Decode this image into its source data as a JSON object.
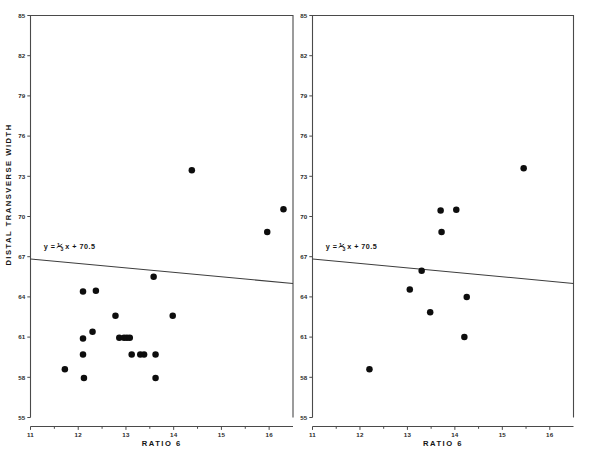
{
  "figure": {
    "background": "#ffffff",
    "ink_color": "#141414",
    "point_color": "#0d0d0d",
    "axis_color": "#4a4a4a"
  },
  "shared": {
    "ylabel": "DISTAL  TRANSVERSE  WIDTH",
    "xlabel": "RATIO  6",
    "yticks": [
      55,
      58,
      61,
      64,
      67,
      70,
      73,
      76,
      79,
      82,
      85
    ],
    "ytick_labels": [
      "55",
      "58",
      "61",
      "64",
      "67",
      "70",
      "73",
      "76",
      "79",
      "82",
      "85"
    ],
    "xticks": [
      11,
      12,
      13,
      14,
      15,
      16
    ],
    "xtick_labels": [
      "11",
      "12",
      "13",
      "14",
      "15",
      "16"
    ],
    "xminor": [
      11.5,
      12.5,
      13.5,
      14.5,
      15.5
    ],
    "ylim": [
      55,
      85
    ],
    "xlim": [
      11,
      16.5
    ],
    "equation_text": "y = −",
    "equation_num": "1",
    "equation_den": "3",
    "equation_tail": "x + 70.5"
  },
  "chart_data": [
    {
      "type": "scatter",
      "panel": "left",
      "title": "",
      "xlabel": "RATIO  6",
      "ylabel": "DISTAL  TRANSVERSE  WIDTH",
      "xlim": [
        11,
        16.5
      ],
      "ylim": [
        55,
        85
      ],
      "grid": false,
      "legend": null,
      "annotations": [
        {
          "text": "y = -1/3 x + 70.5",
          "x": 11.28,
          "y": 67.55
        }
      ],
      "series": [
        {
          "name": "observations",
          "marker": "filled-circle",
          "color": "#0d0d0d",
          "points": [
            [
              11.72,
              58.6
            ],
            [
              12.1,
              60.9
            ],
            [
              12.1,
              59.7
            ],
            [
              12.1,
              64.4
            ],
            [
              12.12,
              57.95
            ],
            [
              12.3,
              61.4
            ],
            [
              12.37,
              64.45
            ],
            [
              12.78,
              62.6
            ],
            [
              12.86,
              60.95
            ],
            [
              12.96,
              60.95
            ],
            [
              13.02,
              60.95
            ],
            [
              13.08,
              60.95
            ],
            [
              13.12,
              59.7
            ],
            [
              13.3,
              59.7
            ],
            [
              13.38,
              59.7
            ],
            [
              13.58,
              65.5
            ],
            [
              13.62,
              59.7
            ],
            [
              13.62,
              57.95
            ],
            [
              13.98,
              62.6
            ],
            [
              14.38,
              73.45
            ],
            [
              15.96,
              68.85
            ],
            [
              16.3,
              70.55
            ]
          ]
        }
      ],
      "regression": {
        "label": "y = -1/3 x + 70.5",
        "slope": -0.3333,
        "intercept": 70.5,
        "x_start": 11.0,
        "x_end": 16.5,
        "y_start": 66.83,
        "y_end": 65.0
      }
    },
    {
      "type": "scatter",
      "panel": "right",
      "title": "",
      "xlabel": "RATIO  6",
      "ylabel": "",
      "xlim": [
        11,
        16.5
      ],
      "ylim": [
        55,
        85
      ],
      "grid": false,
      "legend": null,
      "annotations": [
        {
          "text": "y = -1/3 x + 70.5",
          "x": 11.28,
          "y": 67.55
        }
      ],
      "series": [
        {
          "name": "observations",
          "marker": "filled-circle",
          "color": "#0d0d0d",
          "points": [
            [
              12.2,
              58.6
            ],
            [
              13.05,
              64.55
            ],
            [
              13.3,
              65.95
            ],
            [
              13.48,
              62.85
            ],
            [
              13.7,
              70.45
            ],
            [
              13.72,
              68.85
            ],
            [
              14.03,
              70.5
            ],
            [
              14.2,
              61.0
            ],
            [
              14.25,
              64.0
            ],
            [
              15.45,
              73.6
            ]
          ]
        }
      ],
      "regression": {
        "label": "y = -1/3 x + 70.5",
        "slope": -0.3333,
        "intercept": 70.5,
        "x_start": 11.0,
        "x_end": 16.5,
        "y_start": 66.83,
        "y_end": 65.0
      }
    }
  ]
}
